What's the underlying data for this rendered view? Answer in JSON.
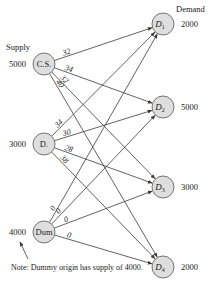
{
  "headers": {
    "supply": "Supply",
    "demand": "Demand"
  },
  "sources": [
    {
      "id": "CS",
      "label": "C.S.",
      "supply": "5000",
      "x": 44,
      "y": 64
    },
    {
      "id": "D",
      "label": "D.",
      "supply": "3000",
      "x": 44,
      "y": 144
    },
    {
      "id": "Dum",
      "label": "Dum",
      "supply": "4000",
      "x": 44,
      "y": 232
    }
  ],
  "destinations": [
    {
      "id": "D1",
      "label": "D",
      "sub": "1",
      "demand": "2000",
      "x": 163,
      "y": 24
    },
    {
      "id": "D2",
      "label": "D",
      "sub": "2",
      "demand": "5000",
      "x": 163,
      "y": 107
    },
    {
      "id": "D3",
      "label": "D",
      "sub": "3",
      "demand": "3000",
      "x": 163,
      "y": 187
    },
    {
      "id": "D4",
      "label": "D",
      "sub": "4",
      "demand": "2000",
      "x": 163,
      "y": 267
    }
  ],
  "edges": [
    {
      "from": "CS",
      "to": "D1",
      "cost": "32"
    },
    {
      "from": "CS",
      "to": "D2",
      "cost": "34"
    },
    {
      "from": "CS",
      "to": "D3",
      "cost": "32"
    },
    {
      "from": "CS",
      "to": "D4",
      "cost": "40"
    },
    {
      "from": "D",
      "to": "D1",
      "cost": "34"
    },
    {
      "from": "D",
      "to": "D2",
      "cost": "30"
    },
    {
      "from": "D",
      "to": "D3",
      "cost": "28"
    },
    {
      "from": "D",
      "to": "D4",
      "cost": "38"
    },
    {
      "from": "Dum",
      "to": "D1",
      "cost": "0"
    },
    {
      "from": "Dum",
      "to": "D2",
      "cost": "0"
    },
    {
      "from": "Dum",
      "to": "D3",
      "cost": "0"
    },
    {
      "from": "Dum",
      "to": "D4",
      "cost": "0"
    }
  ],
  "note": "Note: Dummy origin has supply of 4000."
}
